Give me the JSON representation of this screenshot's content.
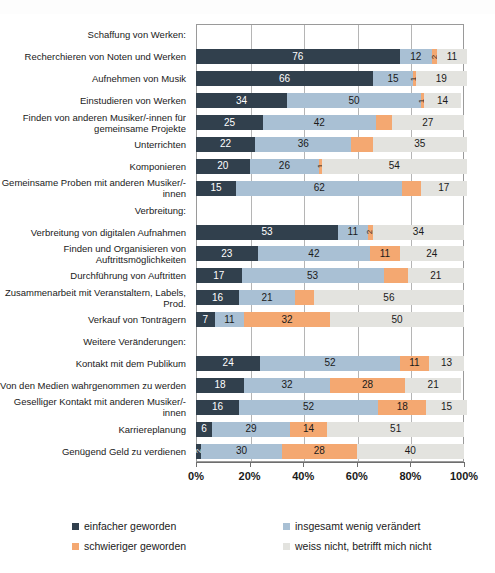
{
  "chart_data": {
    "type": "bar",
    "title": "",
    "subtitle": "",
    "xlabel": "",
    "ylabel": "",
    "orientation": "horizontal",
    "stacked": true,
    "stack_total": 100,
    "xlim": [
      0,
      100
    ],
    "grid": true,
    "legend_position": "bottom",
    "xticks": [
      "0%",
      "20%",
      "40%",
      "60%",
      "80%",
      "100%"
    ],
    "xtick_values": [
      0,
      20,
      40,
      60,
      80,
      100
    ],
    "series": [
      {
        "name": "einfacher geworden",
        "color": "#31404d"
      },
      {
        "name": "insgesamt wenig verändert",
        "color": "#a9c0d4"
      },
      {
        "name": "schwieriger geworden",
        "color": "#f4a871"
      },
      {
        "name": "weiss nicht, betrifft mich nicht",
        "color": "#e3e3df"
      }
    ],
    "rows": [
      {
        "label": "Schaffung von Werken:",
        "group": true,
        "values": []
      },
      {
        "label": "Recherchieren von Noten und Werken",
        "group": false,
        "values": [
          76,
          12,
          2,
          11
        ]
      },
      {
        "label": "Aufnehmen von Musik",
        "group": false,
        "values": [
          66,
          15,
          1,
          19
        ]
      },
      {
        "label": "Einstudieren von Werken",
        "group": false,
        "values": [
          34,
          50,
          1,
          14
        ]
      },
      {
        "label": "Finden von anderen Musiker/-innen für gemeinsame Projekte",
        "group": false,
        "values": [
          25,
          42,
          6,
          27
        ]
      },
      {
        "label": "Unterrichten",
        "group": false,
        "values": [
          22,
          36,
          8,
          35
        ]
      },
      {
        "label": "Komponieren",
        "group": false,
        "values": [
          20,
          26,
          1,
          54
        ]
      },
      {
        "label": "Gemeinsame Proben mit anderen Musiker/-innen",
        "group": false,
        "values": [
          15,
          62,
          7,
          17
        ]
      },
      {
        "label": "Verbreitung:",
        "group": true,
        "values": []
      },
      {
        "label": "Verbreitung von digitalen Aufnahmen",
        "group": false,
        "values": [
          53,
          11,
          2,
          34
        ]
      },
      {
        "label": "Finden und Organisieren von Auftrittsmöglichkeiten",
        "group": false,
        "values": [
          23,
          42,
          11,
          24
        ]
      },
      {
        "label": "Durchführung von Auftritten",
        "group": false,
        "values": [
          17,
          53,
          9,
          21
        ]
      },
      {
        "label": "Zusammenarbeit mit Veranstaltern, Labels, Prod.",
        "group": false,
        "values": [
          16,
          21,
          7,
          56
        ]
      },
      {
        "label": "Verkauf von Tonträgern",
        "group": false,
        "values": [
          7,
          11,
          32,
          50
        ]
      },
      {
        "label": "Weitere Veränderungen:",
        "group": true,
        "values": []
      },
      {
        "label": "Kontakt mit dem Publikum",
        "group": false,
        "values": [
          24,
          52,
          11,
          13
        ]
      },
      {
        "label": "Von den Medien wahrgenommen zu werden",
        "group": false,
        "values": [
          18,
          32,
          28,
          21
        ]
      },
      {
        "label": "Geselliger Kontakt mit anderen Musiker/-innen",
        "group": false,
        "values": [
          16,
          52,
          18,
          15
        ]
      },
      {
        "label": "Karriereplanung",
        "group": false,
        "values": [
          6,
          29,
          14,
          51
        ]
      },
      {
        "label": "Genügend Geld zu verdienen",
        "group": false,
        "values": [
          2,
          30,
          28,
          40
        ]
      }
    ]
  },
  "legend": {
    "items": [
      {
        "label": "einfacher geworden",
        "swatch": "c0"
      },
      {
        "label": "insgesamt wenig verändert",
        "swatch": "c1"
      },
      {
        "label": "schwieriger geworden",
        "swatch": "c2"
      },
      {
        "label": "weiss nicht, betrifft mich nicht",
        "swatch": "c3"
      }
    ]
  }
}
